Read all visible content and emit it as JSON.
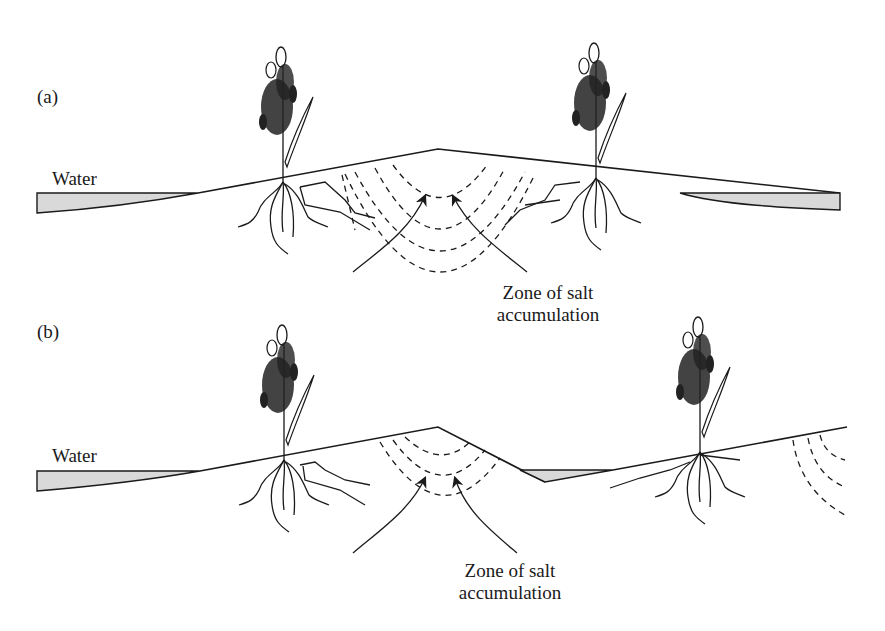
{
  "figure": {
    "panel_a": {
      "label": "(a)",
      "water_label": "Water",
      "zone_label_line1": "Zone of salt",
      "zone_label_line2": "accumulation"
    },
    "panel_b": {
      "label": "(b)",
      "water_label": "Water",
      "zone_label_line1": "Zone of salt",
      "zone_label_line2": "accumulation"
    }
  }
}
